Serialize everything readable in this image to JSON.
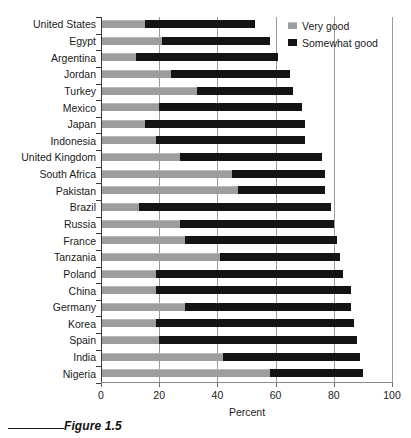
{
  "figure": {
    "caption": "Figure 1.5"
  },
  "legend": {
    "position": "top-right",
    "items": [
      {
        "label": "Very good",
        "color": "#9d9d9d",
        "swatch": "very-good-swatch"
      },
      {
        "label": "Somewhat good",
        "color": "#141414",
        "swatch": "somewhat-good-swatch"
      }
    ]
  },
  "chart_data": {
    "type": "bar",
    "orientation": "horizontal",
    "stacked": true,
    "title": "",
    "xlabel": "Percent",
    "ylabel": "",
    "xlim": [
      0,
      100
    ],
    "xticks": [
      0,
      20,
      40,
      60,
      80,
      100
    ],
    "xticklabels": [
      "0",
      "20",
      "40",
      "60",
      "80",
      "100"
    ],
    "grid": "vertical",
    "legend_entries": [
      "Very good",
      "Somewhat good"
    ],
    "categories": [
      "United States",
      "Egypt",
      "Argentina",
      "Jordan",
      "Turkey",
      "Mexico",
      "Japan",
      "Indonesia",
      "United Kingdom",
      "South Africa",
      "Pakistan",
      "Brazil",
      "Russia",
      "France",
      "Tanzania",
      "Poland",
      "China",
      "Germany",
      "Korea",
      "Spain",
      "India",
      "Nigeria"
    ],
    "series": [
      {
        "name": "Very good",
        "color": "#9d9d9d",
        "values": [
          15,
          21,
          12,
          24,
          33,
          20,
          15,
          19,
          27,
          45,
          47,
          13,
          27,
          29,
          41,
          19,
          19,
          29,
          19,
          20,
          42,
          58
        ]
      },
      {
        "name": "Somewhat good",
        "color": "#141414",
        "values": [
          38,
          37,
          49,
          41,
          33,
          49,
          55,
          51,
          49,
          32,
          30,
          66,
          53,
          52,
          41,
          64,
          67,
          57,
          68,
          68,
          47,
          32
        ]
      }
    ],
    "totals": [
      53,
      58,
      61,
      65,
      66,
      69,
      70,
      70,
      76,
      77,
      77,
      79,
      80,
      81,
      82,
      83,
      86,
      86,
      87,
      88,
      89,
      90
    ]
  }
}
